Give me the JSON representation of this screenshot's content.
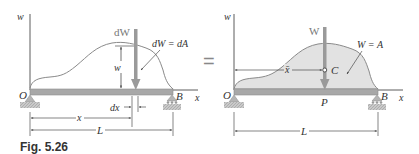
{
  "figure": {
    "caption": "Fig. 5.26",
    "equals_sign": "="
  },
  "left_diagram": {
    "axis_vertical_label": "w",
    "axis_horizontal_label": "x",
    "origin_label": "O",
    "support_right_label": "B",
    "force_label": "dW",
    "element_height_label": "w",
    "equation_label": "dW = dA",
    "element_width_label": "dx",
    "position_label": "x",
    "length_label": "L"
  },
  "right_diagram": {
    "axis_vertical_label": "w",
    "axis_horizontal_label": "x",
    "origin_label": "O",
    "support_right_label": "B",
    "force_label": "W",
    "centroid_label": "C",
    "equation_label": "W = A",
    "centroid_distance_label": "x̄",
    "application_point_label": "P",
    "length_label": "L"
  },
  "colors": {
    "beam": "#a8a8a8",
    "beam_edge": "#8c8c8c",
    "load_curve": "#8a8a8a",
    "load_fill": "#e2e2e2",
    "arrow": "#9a9a9a",
    "line": "#333333",
    "support": "#b5b5b5"
  }
}
